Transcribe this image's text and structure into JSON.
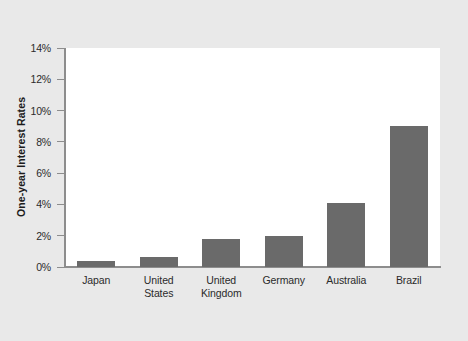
{
  "chart_data": {
    "type": "bar",
    "title": "",
    "subtitle": "",
    "xlabel": "",
    "ylabel": "One-year Interest Rates",
    "categories": [
      "Japan",
      "United States",
      "United Kingdom",
      "Germany",
      "Australia",
      "Brazil"
    ],
    "category_lines": [
      [
        "Japan"
      ],
      [
        "United",
        "States"
      ],
      [
        "United",
        "Kingdom"
      ],
      [
        "Germany"
      ],
      [
        "Australia"
      ],
      [
        "Brazil"
      ]
    ],
    "values": [
      0.4,
      0.65,
      1.8,
      2.0,
      4.1,
      9.0
    ],
    "value_unit": "%",
    "ylim": [
      0,
      14
    ],
    "yticks": [
      0,
      2,
      4,
      6,
      8,
      10,
      12,
      14
    ],
    "ytick_labels": [
      "0%",
      "2%",
      "4%",
      "6%",
      "8%",
      "10%",
      "12%",
      "14%"
    ],
    "grid": false,
    "legend": null,
    "legend_position": "none",
    "bar_color": "#6a6a6a",
    "plot_background": "#ffffff",
    "figure_background": "#e9e9e9",
    "axis_color": "#8d8d8d",
    "text_color": "#2b2b2b"
  }
}
